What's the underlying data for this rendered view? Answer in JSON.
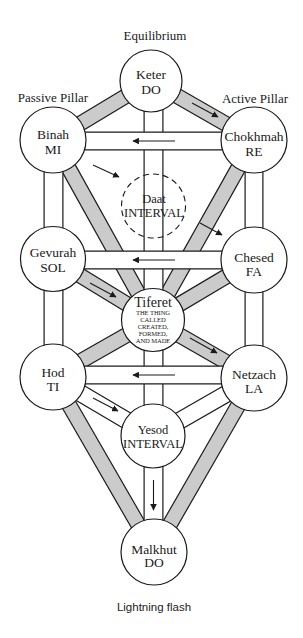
{
  "headings": {
    "center": "Equilibrium",
    "left": "Passive Pillar",
    "right": "Active Pillar"
  },
  "caption": "Lightning flash",
  "nodes": {
    "keter": {
      "name": "Keter",
      "note": "DO"
    },
    "binah": {
      "name": "Binah",
      "note": "MI"
    },
    "chokhmah": {
      "name": "Chokhmah",
      "note": "RE"
    },
    "daat": {
      "name": "Daat",
      "note": "INTERVAL",
      "style": "dashed"
    },
    "gevurah": {
      "name": "Gevurah",
      "note": "SOL"
    },
    "chesed": {
      "name": "Chesed",
      "note": "FA"
    },
    "tiferet": {
      "name": "Tiferet",
      "subtitle": [
        "THE THING",
        "CALLED",
        "CREATED,",
        "FORMED,",
        "AND MADE"
      ]
    },
    "hod": {
      "name": "Hod",
      "note": "TI"
    },
    "netzach": {
      "name": "Netzach",
      "note": "LA"
    },
    "yesod": {
      "name": "Yesod",
      "note": "INTERVAL"
    },
    "malkhut": {
      "name": "Malkhut",
      "note": "DO"
    }
  },
  "paths": [
    {
      "from": "Keter",
      "to": "Binah",
      "fill": "gray"
    },
    {
      "from": "Keter",
      "to": "Chokhmah",
      "fill": "gray",
      "arrow": "toward Chokhmah"
    },
    {
      "from": "Keter",
      "to": "Tiferet",
      "fill": "white",
      "via": "Daat"
    },
    {
      "from": "Chokhmah",
      "to": "Binah",
      "fill": "white",
      "arrow": "toward Binah"
    },
    {
      "from": "Binah",
      "to": "Gevurah",
      "fill": "white"
    },
    {
      "from": "Chokhmah",
      "to": "Chesed",
      "fill": "white"
    },
    {
      "from": "Binah",
      "to": "Tiferet",
      "fill": "gray"
    },
    {
      "from": "Chokhmah",
      "to": "Tiferet",
      "fill": "gray"
    },
    {
      "from": "Binah",
      "to": "Daat",
      "arrow": "toward Daat"
    },
    {
      "from": "Daat",
      "to": "Chesed",
      "arrow": "toward Chesed"
    },
    {
      "from": "Chesed",
      "to": "Gevurah",
      "fill": "white",
      "arrow": "toward Gevurah"
    },
    {
      "from": "Gevurah",
      "to": "Tiferet",
      "fill": "gray",
      "arrow": "toward Tiferet"
    },
    {
      "from": "Chesed",
      "to": "Tiferet",
      "fill": "gray"
    },
    {
      "from": "Gevurah",
      "to": "Hod",
      "fill": "white"
    },
    {
      "from": "Chesed",
      "to": "Netzach",
      "fill": "white"
    },
    {
      "from": "Tiferet",
      "to": "Hod",
      "fill": "gray"
    },
    {
      "from": "Tiferet",
      "to": "Netzach",
      "fill": "gray",
      "arrow": "toward Netzach"
    },
    {
      "from": "Tiferet",
      "to": "Yesod",
      "fill": "white"
    },
    {
      "from": "Netzach",
      "to": "Hod",
      "fill": "white",
      "arrow": "toward Hod"
    },
    {
      "from": "Hod",
      "to": "Yesod",
      "fill": "white",
      "arrow": "toward Yesod"
    },
    {
      "from": "Netzach",
      "to": "Yesod",
      "fill": "white"
    },
    {
      "from": "Hod",
      "to": "Malkhut",
      "fill": "gray"
    },
    {
      "from": "Netzach",
      "to": "Malkhut",
      "fill": "gray"
    },
    {
      "from": "Yesod",
      "to": "Malkhut",
      "fill": "white",
      "arrow": "toward Malkhut"
    }
  ],
  "colors": {
    "gray_path": "#cbcbcb",
    "white_path": "#ffffff",
    "outline": "#1a1a1a"
  }
}
